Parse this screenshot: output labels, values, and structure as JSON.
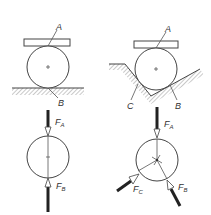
{
  "diagram": {
    "title": "",
    "panels": [
      {
        "id": "flat-support",
        "labels": {
          "top_contact": "A",
          "bottom_contact": "B"
        }
      },
      {
        "id": "v-groove-support",
        "labels": {
          "top_contact": "A",
          "right_contact": "B",
          "left_contact": "C"
        }
      }
    ],
    "free_body": [
      {
        "id": "flat-fbd",
        "forces": [
          {
            "name": "F",
            "sub": "A"
          },
          {
            "name": "F",
            "sub": "B"
          }
        ]
      },
      {
        "id": "groove-fbd",
        "forces": [
          {
            "name": "F",
            "sub": "A"
          },
          {
            "name": "F",
            "sub": "C"
          },
          {
            "name": "F",
            "sub": "B"
          }
        ]
      }
    ]
  }
}
